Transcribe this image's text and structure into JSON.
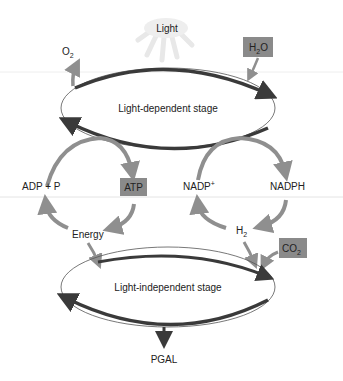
{
  "colors": {
    "dark_arrow": "#3a3a3a",
    "light_arrow": "#8f8f8f",
    "box_fill": "#8a8a8a",
    "ray": "#e8e8e8",
    "text": "#222222"
  },
  "light_source": {
    "label": "Light"
  },
  "light_dependent_stage": {
    "label": "Light-dependent stage",
    "input": {
      "label": "H",
      "sub": "2",
      "suffix": "O"
    },
    "output": {
      "label": "O",
      "sub": "2"
    }
  },
  "atp_cycle": {
    "left_label": "ADP + P",
    "right_label": "ATP",
    "bottom_label": "Energy"
  },
  "nadp_cycle": {
    "left_label": "NADP",
    "left_sup": "+",
    "right_label": "NADPH",
    "bottom_label": "H",
    "bottom_sub": "2"
  },
  "light_independent_stage": {
    "label": "Light-independent stage",
    "input": {
      "label": "CO",
      "sub": "2"
    },
    "output": {
      "label": "PGAL"
    }
  }
}
